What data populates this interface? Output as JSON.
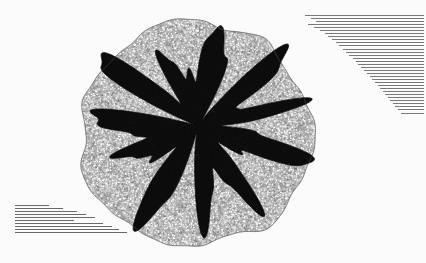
{
  "figure": {
    "type": "finite-element-mesh",
    "background_color": "#fbfbfb",
    "canvas": {
      "width": 426,
      "height": 263
    },
    "outer_domain": {
      "name": "coarse-mesh-annulus",
      "description": "Near-circular outer domain filled with a moderately fine unstructured mesh rendered as light grey cells with dark edges",
      "fill_color": "#b9b9b9",
      "edge_color": "#4a4a4a",
      "center": {
        "x": 196,
        "y": 134
      },
      "radius_x": 116,
      "radius_y": 112,
      "boundary_left_x": 82,
      "boundary_right_x": 312,
      "boundary_top_y": 24,
      "boundary_bottom_y": 247,
      "cell_size_px": 2.1
    },
    "inner_region": {
      "name": "refined-inclusion",
      "description": "Irregular lobed inner inclusion meshed at very high refinement so element edges merge into a solid dark mass",
      "fill_color": "#0c0c0c",
      "edge_color": "#000000",
      "center": {
        "x": 198,
        "y": 126
      },
      "mean_radius": 68,
      "lobe_count": 11,
      "lobe_amplitude": 9
    },
    "annotations": {
      "left_block": {
        "name": "lower-left-annotation-text",
        "description": "Left-aligned paragraph of very small illegible annotation text",
        "alignment": "left",
        "x": 15,
        "y": 205,
        "line_count": 10,
        "line_widths_px": [
          34,
          48,
          62,
          71,
          80,
          59,
          88,
          97,
          104,
          112
        ],
        "color": "#6a6a6a"
      },
      "right_block": {
        "name": "upper-right-annotation-text",
        "description": "Right-aligned wedge of very small illegible annotation text whose lines shorten toward the bottom",
        "alignment": "right",
        "x": 424,
        "y": 15,
        "line_count": 33,
        "line_widths_px": [
          119,
          113,
          108,
          116,
          110,
          104,
          99,
          96,
          92,
          88,
          85,
          81,
          78,
          75,
          71,
          68,
          66,
          63,
          60,
          57,
          54,
          52,
          49,
          46,
          44,
          41,
          39,
          36,
          34,
          31,
          29,
          26,
          23
        ],
        "color": "#7a7a7a"
      }
    }
  }
}
